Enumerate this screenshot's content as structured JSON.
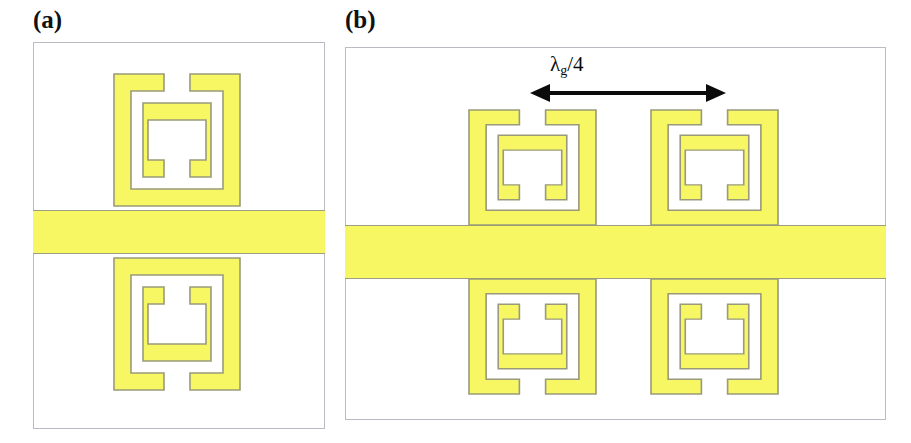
{
  "figure": {
    "background_color": "#ffffff",
    "metal_color": "#f7f763",
    "metal_outline_color": "#9a9a7a",
    "panel_border_color": "#b9bcc2",
    "annotation_color": "#0b0b0b",
    "width": 911,
    "height": 443
  },
  "panels": [
    {
      "label": "(a)",
      "name": "panel-a",
      "resonator_count": 2,
      "resonator_rows": 2,
      "resonator_cols": 1,
      "has_microstrip": true,
      "annotation": null
    },
    {
      "label": "(b)",
      "name": "panel-b",
      "resonator_count": 4,
      "resonator_rows": 2,
      "resonator_cols": 2,
      "has_microstrip": true,
      "annotation": {
        "symbol": "λ",
        "subscript": "g",
        "suffix": "/4",
        "full_text": "λg/4",
        "arrow_style": "double-headed-horizontal"
      }
    }
  ],
  "resonators": [
    {
      "name": "srr-a-top",
      "panel": "a",
      "orientation": "outer-gap-top",
      "row": "top"
    },
    {
      "name": "srr-a-bottom",
      "panel": "a",
      "orientation": "outer-gap-bottom",
      "row": "bottom"
    },
    {
      "name": "srr-b-top-left",
      "panel": "b",
      "orientation": "outer-gap-top",
      "row": "top"
    },
    {
      "name": "srr-b-top-right",
      "panel": "b",
      "orientation": "outer-gap-top",
      "row": "top"
    },
    {
      "name": "srr-b-bottom-left",
      "panel": "b",
      "orientation": "outer-gap-bottom",
      "row": "bottom"
    },
    {
      "name": "srr-b-bottom-right",
      "panel": "b",
      "orientation": "outer-gap-bottom",
      "row": "bottom"
    }
  ]
}
